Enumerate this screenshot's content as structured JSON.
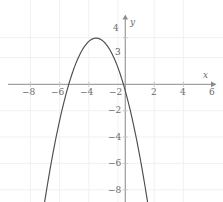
{
  "figure": {
    "background_color": "#ffffff",
    "axis_color": "#8a8a8a",
    "grid_color": "#f0f0f0",
    "curve_color": "#4d4d4d",
    "label_color": "#6b6b6b",
    "x_axis_label": "x",
    "y_axis_label": "y"
  },
  "chart_data": {
    "type": "line",
    "title": "",
    "xlabel": "x",
    "ylabel": "y",
    "xlim": [
      -9,
      7
    ],
    "ylim": [
      -8.8,
      4.6
    ],
    "grid": true,
    "legend": "none",
    "xticks": [
      -8,
      -6,
      -4,
      -2,
      2,
      4,
      6
    ],
    "xtick_labels": [
      "−8",
      "−6",
      "−4",
      "−2",
      "2",
      "4",
      "6"
    ],
    "yticks": [
      4,
      3,
      -2,
      -4,
      -6,
      -8
    ],
    "ytick_labels": [
      "4",
      "3",
      "−2",
      "−4",
      "−6",
      "−8"
    ],
    "series": [
      {
        "name": "parabola",
        "equation": "y = -(x + 2)^2 + 3.5",
        "vertex": [
          -2,
          3.5
        ],
        "opens": "down",
        "x_intercepts": [
          -3.871,
          0.129
        ],
        "y_intercept": 3.5,
        "x": [
          -6.35,
          -6.0,
          -5.5,
          -5.0,
          -4.5,
          -4.0,
          -3.5,
          -3.0,
          -2.5,
          -2.0,
          -1.5,
          -1.0,
          -0.5,
          0.0,
          0.5,
          1.0,
          1.5,
          2.0,
          2.35
        ],
        "y": [
          -15.4,
          -12.5,
          -8.75,
          -5.5,
          -2.75,
          -0.5,
          1.25,
          2.5,
          3.25,
          3.5,
          3.25,
          2.5,
          1.25,
          -0.5,
          -2.75,
          -5.5,
          -8.75,
          -12.5,
          -15.4
        ]
      }
    ]
  }
}
